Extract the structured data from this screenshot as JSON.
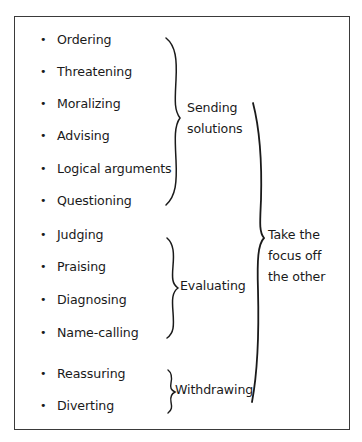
{
  "figure": {
    "groups": [
      {
        "label_lines": [
          "Sending",
          "solutions"
        ],
        "items": [
          "Ordering",
          "Threatening",
          "Moralizing",
          "Advising",
          "Logical arguments",
          "Questioning"
        ]
      },
      {
        "label_lines": [
          "Evaluating"
        ],
        "items": [
          "Judging",
          "Praising",
          "Diagnosing",
          "Name-calling"
        ]
      },
      {
        "label_lines": [
          "Withdrawing"
        ],
        "items": [
          "Reassuring",
          "Diverting"
        ]
      }
    ],
    "overall_label_lines": [
      "Take the",
      "focus off",
      "the other"
    ],
    "bullet": "•",
    "colors": {
      "ink": "#1a1a1a",
      "border": "#3a3a3a",
      "background": "#ffffff"
    }
  }
}
